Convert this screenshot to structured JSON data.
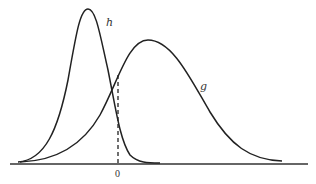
{
  "diagram": {
    "type": "density-curves",
    "curves": [
      {
        "id": "h",
        "label": "h",
        "description": "narrow, tall peaked density left of zero",
        "peak_x_px": 88,
        "peak_y_px": 9
      },
      {
        "id": "g",
        "label": "g",
        "description": "wider, lower density peaked right of zero",
        "peak_x_px": 148,
        "peak_y_px": 40
      }
    ],
    "axis": {
      "tick_label": "0"
    },
    "dashed_line": {
      "at": "0",
      "from": "axis",
      "to": "curve g"
    },
    "colors": {
      "stroke": "#222222",
      "background": "#ffffff"
    }
  }
}
